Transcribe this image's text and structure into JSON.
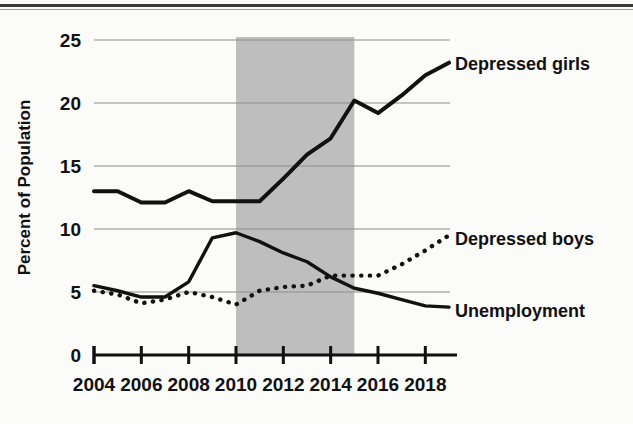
{
  "figure": {
    "title": "",
    "y_axis_title": "Percent of Population"
  },
  "axis": {
    "y_ticks": [
      "0",
      "5",
      "10",
      "15",
      "20",
      "25"
    ],
    "x_ticks": [
      "2004",
      "2006",
      "2008",
      "2010",
      "2012",
      "2014",
      "2016",
      "2018"
    ]
  },
  "series_labels": {
    "girls": "Depressed girls",
    "boys": "Depressed boys",
    "unemployment": "Unemployment"
  },
  "colors": {
    "line": "#111111",
    "gridline": "#8c8c8c",
    "shaded_band": "#bebebe",
    "background": "#fbfbfa"
  },
  "chart_data": {
    "type": "line",
    "title": "",
    "xlabel": "",
    "ylabel": "Percent of Population",
    "xlim": [
      2004,
      2019
    ],
    "ylim": [
      0,
      25
    ],
    "grid": true,
    "legend_position": "right-inline",
    "x": [
      2004,
      2005,
      2006,
      2007,
      2008,
      2009,
      2010,
      2011,
      2012,
      2013,
      2014,
      2015,
      2016,
      2017,
      2018,
      2019
    ],
    "series": [
      {
        "name": "Depressed girls",
        "style": "solid-thick",
        "values": [
          13.0,
          13.0,
          12.1,
          12.1,
          13.0,
          12.2,
          12.2,
          12.2,
          14.0,
          15.9,
          17.2,
          20.2,
          19.2,
          20.6,
          22.2,
          23.2
        ]
      },
      {
        "name": "Depressed boys",
        "style": "dotted",
        "values": [
          5.1,
          4.8,
          4.1,
          4.4,
          5.0,
          4.6,
          4.0,
          5.1,
          5.4,
          5.5,
          6.3,
          6.3,
          6.3,
          7.2,
          8.3,
          9.5
        ]
      },
      {
        "name": "Unemployment",
        "style": "solid-thin",
        "values": [
          5.5,
          5.1,
          4.6,
          4.6,
          5.8,
          9.3,
          9.7,
          9.0,
          8.1,
          7.4,
          6.2,
          5.3,
          4.9,
          4.4,
          3.9,
          3.8
        ]
      }
    ],
    "annotations": [
      {
        "type": "vertical-band",
        "name": "shaded-period",
        "x_start": 2010,
        "x_end": 2015,
        "color": "#bebebe"
      }
    ]
  }
}
